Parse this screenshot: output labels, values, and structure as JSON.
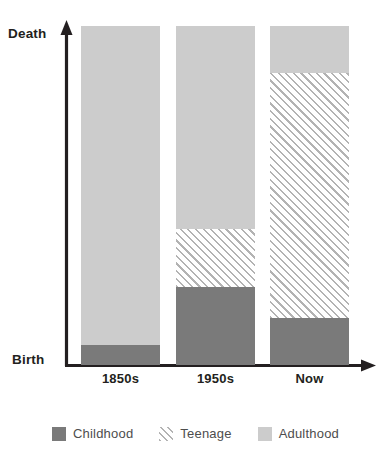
{
  "chart_data": {
    "type": "bar",
    "subtype": "stacked-bar-100",
    "title": "",
    "xlabel": "",
    "ylabel": "",
    "categories": [
      "1850s",
      "1950s",
      "Now"
    ],
    "series": [
      {
        "name": "Childhood",
        "values": [
          6,
          23,
          14
        ],
        "color": "#7a7a7a",
        "fill": "solid"
      },
      {
        "name": "Teenage",
        "values": [
          0,
          17,
          72
        ],
        "color": "#b3b3b3",
        "fill": "diagonal-hatch"
      },
      {
        "name": "Adulthood",
        "values": [
          94,
          60,
          14
        ],
        "color": "#cccccc",
        "fill": "solid"
      }
    ],
    "ylim": [
      0,
      100
    ],
    "y_axis_endpoints": {
      "low": "Birth",
      "high": "Death"
    },
    "grid": false,
    "legend_position": "bottom",
    "units": "percent of lifespan"
  },
  "axis": {
    "y_top_label": "Death",
    "y_bottom_label": "Birth",
    "axis_color": "#231f20"
  },
  "ticks": [
    {
      "label": "1850s"
    },
    {
      "label": "1950s"
    },
    {
      "label": "Now"
    }
  ],
  "bars": [
    {
      "category": "1850s",
      "segments": [
        {
          "name": "Adulthood",
          "percent": 94
        },
        {
          "name": "Teenage",
          "percent": 0
        },
        {
          "name": "Childhood",
          "percent": 6
        }
      ]
    },
    {
      "category": "1950s",
      "segments": [
        {
          "name": "Adulthood",
          "percent": 60
        },
        {
          "name": "Teenage",
          "percent": 17
        },
        {
          "name": "Childhood",
          "percent": 23
        }
      ]
    },
    {
      "category": "Now",
      "segments": [
        {
          "name": "Adulthood",
          "percent": 14
        },
        {
          "name": "Teenage",
          "percent": 72
        },
        {
          "name": "Childhood",
          "percent": 14
        }
      ]
    }
  ],
  "legend": {
    "items": [
      {
        "label": "Childhood",
        "color": "#7a7a7a",
        "pattern": "solid"
      },
      {
        "label": "Teenage",
        "color": "#b3b3b3",
        "pattern": "diagonal-hatch"
      },
      {
        "label": "Adulthood",
        "color": "#cccccc",
        "pattern": "solid"
      }
    ]
  },
  "colors": {
    "childhood": "#7a7a7a",
    "teenage_hatch": "#b3b3b3",
    "adulthood": "#cccccc",
    "axis": "#231f20",
    "label_text": "#231f20",
    "legend_text": "#4d4d4d",
    "background": "#ffffff"
  }
}
